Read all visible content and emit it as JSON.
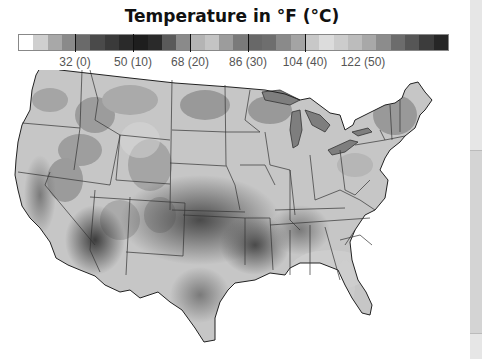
{
  "title": "Temperature in °F (°C)",
  "legend": {
    "swatches": [
      "#ffffff",
      "#cfcfcf",
      "#a8a8a8",
      "#8a8a8a",
      "#6a6a6a",
      "#4a4a4a",
      "#3a3a3a",
      "#2a2a2a",
      "#1e1e1e",
      "#2a2a2a",
      "#5a5a5a",
      "#8a8a8a",
      "#b4b4b4",
      "#c4c4c4",
      "#9c9c9c",
      "#7a7a7a",
      "#686868",
      "#6e6e6e",
      "#8a8a8a",
      "#a4a4a4",
      "#c8c8c8",
      "#dcdcdc",
      "#cccccc",
      "#bcbcbc",
      "#a8a8a8",
      "#8c8c8c",
      "#6c6c6c",
      "#565656",
      "#3c3c3c",
      "#262626"
    ],
    "ticks": [
      {
        "label": "32 (0)",
        "value_f": 32
      },
      {
        "label": "50 (10)",
        "value_f": 50
      },
      {
        "label": "68 (20)",
        "value_f": 68
      },
      {
        "label": "86 (30)",
        "value_f": 86
      },
      {
        "label": "104 (40)",
        "value_f": 104
      },
      {
        "label": "122 (50)",
        "value_f": 122
      }
    ],
    "range_f": [
      14,
      149
    ]
  },
  "map": {
    "region": "Contiguous United States",
    "hot_regions": [
      "Desert Southwest",
      "Southern Plains",
      "Central Valley CA"
    ],
    "cool_regions": [
      "Northern Rockies",
      "Great Lakes",
      "New England"
    ]
  }
}
